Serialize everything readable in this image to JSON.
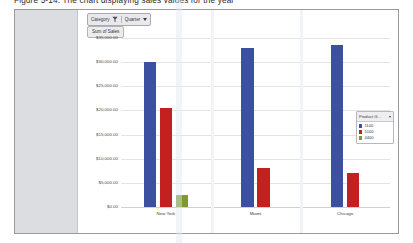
{
  "page": {
    "heading": "Figure 5-14: The chart displaying sales values for the year"
  },
  "toolbar": {
    "category_label": "Category",
    "funnel_icon": "funnel-icon",
    "quarter_label": "Quarter",
    "caret_icon": "chevron-down-icon"
  },
  "y_axis_title_button": "Sum of Sales",
  "legend": {
    "title": "Product G...",
    "caret_icon": "chevron-down-icon",
    "items": [
      {
        "label": "1100",
        "color": "#3b50a0"
      },
      {
        "label": "5100",
        "color": "#c32020"
      },
      {
        "label": "4400",
        "color": "#7f9a2b"
      }
    ]
  },
  "chart_data": {
    "type": "bar",
    "title": "",
    "subtitle": "",
    "xlabel": "",
    "ylabel": "Sum of Sales",
    "categories": [
      "New York",
      "Miami",
      "Chicago"
    ],
    "series": [
      {
        "name": "1100",
        "color": "#3b50a0",
        "values": [
          30000,
          33000,
          33500
        ]
      },
      {
        "name": "5100",
        "color": "#c32020",
        "values": [
          20500,
          8000,
          7000
        ]
      },
      {
        "name": "4400",
        "color": "#7f9a2b",
        "values": [
          2500,
          0,
          0
        ]
      }
    ],
    "ylim": [
      0,
      35000
    ],
    "ytick_values": [
      0,
      5000,
      10000,
      15000,
      20000,
      25000,
      30000,
      35000
    ],
    "ytick_labels": [
      "$0.00",
      "$5,000.00",
      "$10,000.00",
      "$15,000.00",
      "$20,000.00",
      "$25,000.00",
      "$30,000.00",
      "$35,000.00"
    ],
    "grid": true,
    "legend_position": "right"
  }
}
